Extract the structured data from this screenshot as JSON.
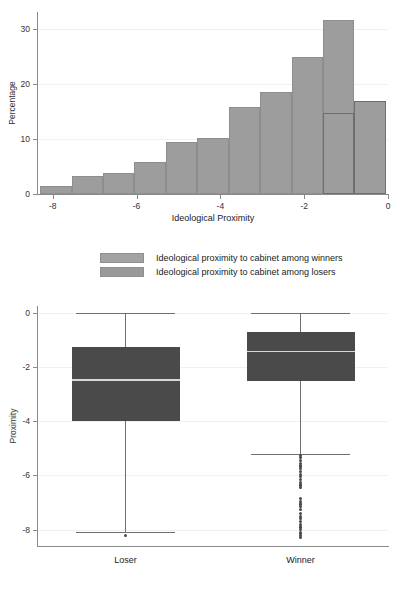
{
  "chart_data": [
    {
      "type": "bar",
      "id": "histogram",
      "title": "",
      "xlabel": "Ideological Proximity",
      "ylabel": "Percentage",
      "xlim": [
        -8.35,
        0
      ],
      "ylim": [
        0,
        33
      ],
      "xticks": [
        -8,
        -6,
        -4,
        -2,
        0
      ],
      "xticklabels": [
        "-8",
        "-6",
        "-4",
        "-2",
        "0"
      ],
      "yticks": [
        0,
        10,
        20,
        30
      ],
      "yticklabels": [
        "0",
        "10",
        "20",
        "30"
      ],
      "grid": true,
      "bin_width": 0.75,
      "bin_left_edges": [
        -8.3,
        -7.55,
        -6.8,
        -6.05,
        -5.3,
        -4.55,
        -3.8,
        -3.05,
        -2.3,
        -1.55,
        -0.8
      ],
      "series": [
        {
          "name": "Ideological proximity to cabinet among winners",
          "color": "#9d9d9d",
          "values": [
            1.4,
            3.2,
            3.9,
            5.8,
            9.4,
            10.2,
            15.8,
            18.5,
            24.8,
            31.5
          ]
        },
        {
          "name": "Ideological proximity to cabinet among losers",
          "color": "#9d9d9d",
          "outline": "#6e6e6e",
          "bin_left_edges": [
            -1.55,
            -0.8
          ],
          "values": [
            14.6,
            16.8
          ]
        }
      ],
      "legend": {
        "position": "below-axis",
        "entries": [
          "Ideological proximity to cabinet among winners",
          "Ideological proximity to cabinet among losers"
        ]
      }
    },
    {
      "type": "box",
      "id": "boxplot",
      "title": "",
      "xlabel": "",
      "ylabel": "Proximity",
      "ylim": [
        -8.6,
        0.25
      ],
      "yticks": [
        0,
        -2,
        -4,
        -6,
        -8
      ],
      "yticklabels": [
        "0",
        "-2",
        "-4",
        "-6",
        "-8"
      ],
      "grid": true,
      "categories": [
        "Loser",
        "Winner"
      ],
      "boxes": [
        {
          "label": "Loser",
          "whisker_high": 0.0,
          "q3": -1.25,
          "median": -2.45,
          "q1": -4.0,
          "whisker_low": -8.1,
          "outliers": [
            -8.22
          ],
          "color": "#4a4a4a"
        },
        {
          "label": "Winner",
          "whisker_high": 0.0,
          "q3": -0.7,
          "median": -1.4,
          "q1": -2.5,
          "whisker_low": -5.2,
          "outliers": [
            -5.25,
            -5.35,
            -5.45,
            -5.55,
            -5.65,
            -5.75,
            -5.85,
            -5.95,
            -6.05,
            -6.15,
            -6.25,
            -6.35,
            -6.45,
            -6.85,
            -6.95,
            -7.05,
            -7.15,
            -7.25,
            -7.4,
            -7.5,
            -7.6,
            -7.7,
            -7.8,
            -7.9,
            -8.0,
            -8.12,
            -8.22,
            -8.3
          ],
          "color": "#4a4a4a"
        }
      ]
    }
  ],
  "colors": {
    "bar_fill": "#9d9d9d",
    "bar_outline": "#8e8e8e",
    "overlay_outline": "#6e6e6e",
    "box_fill": "#4a4a4a",
    "median_line": "#d8d8d8",
    "whisker": "#6f6f6f",
    "axis": "#8a8a8a",
    "grid": "#f0f0f0",
    "background": "#ffffff"
  }
}
